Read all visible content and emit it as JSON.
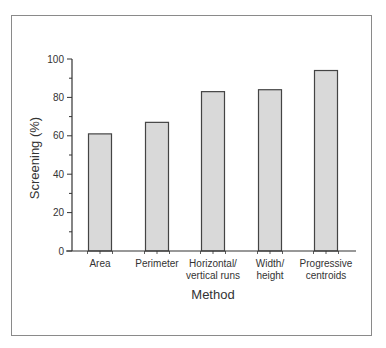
{
  "chart_data": {
    "type": "bar",
    "title": "",
    "xlabel": "Method",
    "ylabel": "Screening (%)",
    "ylim": [
      0,
      100
    ],
    "yticks": [
      0,
      20,
      40,
      60,
      80,
      100
    ],
    "categories": [
      "Area",
      "Perimeter",
      "Horizontal/\nvertical runs",
      "Width/\nheight",
      "Progressive\ncentroids"
    ],
    "category_lines": [
      [
        "Area"
      ],
      [
        "Perimeter"
      ],
      [
        "Horizontal/",
        "vertical runs"
      ],
      [
        "Width/",
        "height"
      ],
      [
        "Progressive",
        "centroids"
      ]
    ],
    "values": [
      61,
      67,
      83,
      84,
      94
    ],
    "grid": false,
    "legend": null,
    "colors": {
      "bar_fill": "#d9d9d9",
      "bar_edge": "#444444",
      "axis": "#333333",
      "frame": "#8a8a8a"
    }
  }
}
